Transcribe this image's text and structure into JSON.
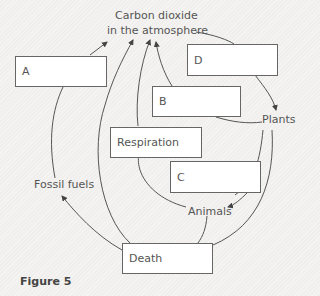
{
  "diagram": {
    "title_nodes": {
      "co2_line1": "Carbon dioxide",
      "co2_line2": "in the atmosphere",
      "plants": "Plants",
      "animals": "Animals",
      "fossil_fuels": "Fossil fuels"
    },
    "boxes": {
      "a": "A",
      "d": "D",
      "b": "B",
      "respiration": "Respiration",
      "c": "C",
      "death": "Death"
    },
    "caption": "Figure 5"
  }
}
